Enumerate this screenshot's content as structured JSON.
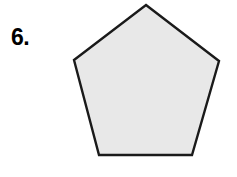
{
  "page": {
    "background_color": "#ffffff",
    "width": 237,
    "height": 177
  },
  "problem": {
    "number_label": "6."
  },
  "figure": {
    "shape_name": "pentagon",
    "sides": 5,
    "fill_color": "#e8e8e8",
    "stroke_color": "#1a1a1a",
    "stroke_width": 2.4,
    "vertices": "146,5 219,61 192,155 99,155 74,60",
    "vertex_list": [
      {
        "name": "apex",
        "x": 146,
        "y": 5
      },
      {
        "name": "right",
        "x": 219,
        "y": 61
      },
      {
        "name": "bottom-right",
        "x": 192,
        "y": 155
      },
      {
        "name": "bottom-left",
        "x": 99,
        "y": 155
      },
      {
        "name": "left",
        "x": 74,
        "y": 60
      }
    ]
  }
}
